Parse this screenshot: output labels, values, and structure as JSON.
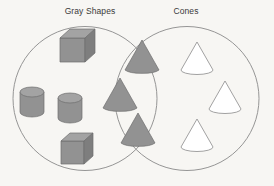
{
  "diagram": {
    "type": "venn",
    "background_color": "#f7f6f3",
    "left_set": {
      "label": "Gray Shapes",
      "label_x": 90,
      "label_y": 11,
      "circle": {
        "cx": 85,
        "cy": 98.5,
        "r": 72
      },
      "stroke_color": "#8a8a8a"
    },
    "right_set": {
      "label": "Cones",
      "label_x": 186,
      "label_y": 11,
      "circle": {
        "cx": 187,
        "cy": 98.5,
        "r": 72
      },
      "stroke_color": "#8a8a8a"
    },
    "fill_gray": "#929292",
    "fill_white": "#ffffff",
    "regions": {
      "left_only": {
        "name": "gray-shapes-only",
        "description": "gray cubes and gray cylinders",
        "count": 4,
        "items": [
          {
            "shape": "cube",
            "color": "gray",
            "cx": 76,
            "cy": 46,
            "size": 33
          },
          {
            "shape": "cylinder",
            "color": "gray",
            "cx": 32,
            "cy": 99,
            "size": 23
          },
          {
            "shape": "cylinder",
            "color": "gray",
            "cx": 70,
            "cy": 105,
            "size": 23
          },
          {
            "shape": "cube",
            "color": "gray",
            "cx": 76,
            "cy": 148,
            "size": 31
          }
        ]
      },
      "intersection": {
        "name": "gray-cones",
        "description": "gray cones: both gray and cone",
        "count": 3,
        "items": [
          {
            "shape": "cone",
            "color": "gray",
            "cx": 142,
            "cy": 58,
            "size": 30
          },
          {
            "shape": "cone",
            "color": "gray",
            "cx": 120,
            "cy": 96,
            "size": 30
          },
          {
            "shape": "cone",
            "color": "gray",
            "cx": 138,
            "cy": 131,
            "size": 30
          }
        ]
      },
      "right_only": {
        "name": "cones-only",
        "description": "white outline cones",
        "count": 3,
        "items": [
          {
            "shape": "cone",
            "color": "white",
            "cx": 197,
            "cy": 58,
            "size": 28
          },
          {
            "shape": "cone",
            "color": "white",
            "cx": 225,
            "cy": 97,
            "size": 28
          },
          {
            "shape": "cone",
            "color": "white",
            "cx": 197,
            "cy": 135,
            "size": 28
          }
        ]
      }
    }
  }
}
